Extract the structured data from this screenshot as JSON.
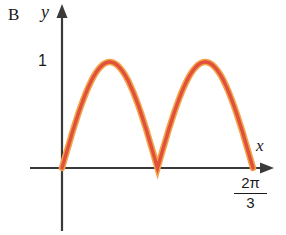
{
  "figure": {
    "label": "B",
    "axis": {
      "x_label": "x",
      "y_label": "y",
      "y_tick": "1",
      "x_tick_numerator": "2π",
      "x_tick_denominator": "3"
    },
    "colors": {
      "curve_core": "#e0503a",
      "curve_halo": "#f2a44a",
      "axis": "#3a3a3a",
      "text": "#1a1a1a"
    }
  },
  "chart_data": {
    "type": "line",
    "title": "",
    "xlabel": "x",
    "ylabel": "y",
    "function": "y = |sin(3x)|",
    "amplitude": 1,
    "frequency": 3,
    "x_range": [
      0,
      2.0944
    ],
    "y_range": [
      0,
      1
    ],
    "x_tick_labels": [
      "2π/3"
    ],
    "y_tick_labels": [
      "1"
    ],
    "key_points": {
      "zeros_x": [
        0,
        1.0472,
        2.0944
      ],
      "maxima_x": [
        0.5236,
        1.5708
      ],
      "maxima_y": 1
    },
    "grid": false,
    "legend": "none"
  }
}
